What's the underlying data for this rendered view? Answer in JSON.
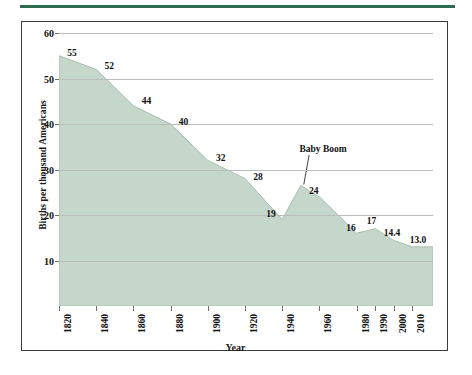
{
  "figure": {
    "y_axis_title": "Births per thousand Americans",
    "x_axis_title": "Year",
    "accent_rule_color": "#2f6b52",
    "area_fill_color": "#c5d6cb",
    "area_edge_color": "#a8bfb1",
    "grid_color": "#b9bdbb",
    "frame_color": "#3a3a3a"
  },
  "annotations": [
    {
      "name": "baby-boom",
      "text": "Baby Boom",
      "x": 1962,
      "y": 34.5,
      "target_x": 1950,
      "target_y": 26.5
    }
  ],
  "chart_data": {
    "type": "area",
    "title": "",
    "subtitle": "",
    "xlabel": "Year",
    "ylabel": "Births per thousand Americans",
    "xlim": [
      1820,
      2020
    ],
    "ylim": [
      0,
      60
    ],
    "grid": true,
    "legend": "none",
    "y_ticks": [
      10,
      20,
      30,
      40,
      50,
      60
    ],
    "x_ticks": [
      1820,
      1840,
      1860,
      1880,
      1900,
      1920,
      1940,
      1960,
      1980,
      1990,
      2000,
      2010
    ],
    "x": [
      1820,
      1840,
      1860,
      1880,
      1900,
      1920,
      1940,
      1950,
      1960,
      1980,
      1990,
      2000,
      2010
    ],
    "values": [
      55,
      52,
      44,
      40,
      32,
      28,
      19,
      26.5,
      24,
      16,
      17,
      14.4,
      13.0
    ],
    "point_labels": [
      {
        "x": 1820,
        "value": 55,
        "text": "55",
        "label_x": 1827,
        "label_y": 55.5
      },
      {
        "x": 1840,
        "value": 52,
        "text": "52",
        "label_x": 1847,
        "label_y": 52.7
      },
      {
        "x": 1860,
        "value": 44,
        "text": "44",
        "label_x": 1867,
        "label_y": 45.0
      },
      {
        "x": 1880,
        "value": 40,
        "text": "40",
        "label_x": 1887,
        "label_y": 40.5
      },
      {
        "x": 1900,
        "value": 32,
        "text": "32",
        "label_x": 1907,
        "label_y": 32.5
      },
      {
        "x": 1920,
        "value": 28,
        "text": "28",
        "label_x": 1927,
        "label_y": 28.4
      },
      {
        "x": 1940,
        "value": 19,
        "text": "19",
        "label_x": 1934,
        "label_y": 20.2
      },
      {
        "x": 1960,
        "value": 24,
        "text": "24",
        "label_x": 1957,
        "label_y": 25.2
      },
      {
        "x": 1980,
        "value": 16,
        "text": "16",
        "label_x": 1977,
        "label_y": 17.2
      },
      {
        "x": 1990,
        "value": 17,
        "text": "17",
        "label_x": 1988,
        "label_y": 18.6
      },
      {
        "x": 2000,
        "value": 14.4,
        "text": "14.4",
        "label_x": 1999,
        "label_y": 16.0
      },
      {
        "x": 2010,
        "value": 13.0,
        "text": "13.0",
        "label_x": 2013,
        "label_y": 14.4
      }
    ]
  }
}
